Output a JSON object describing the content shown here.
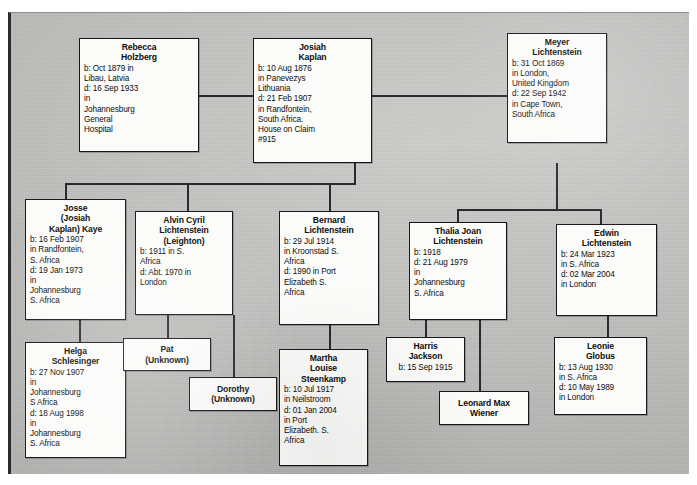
{
  "document": {
    "kind": "genealogy-family-tree-chart",
    "title": "Kaplan / Lichtenstein Family Tree"
  },
  "people": [
    {
      "id": "rebecca-holzberg",
      "name": "Rebecca\nHolzberg",
      "details": "b: Oct 1879 in\nLibau, Latvia\nd: 16 Sep 1933\nin\nJohannesburg\nGeneral\nHospital",
      "generation": 1
    },
    {
      "id": "josiah-kaplan",
      "name": "Josiah\nKaplan",
      "details": "b: 10 Aug 1876\nin Panevezys\nLithuania\nd: 21 Feb 1907\nin Randfontein,\nSouth Africa.\nHouse on Claim\n#915",
      "generation": 1
    },
    {
      "id": "meyer-lichtenstein",
      "name": "Meyer\nLichtenstein",
      "details": "b: 31 Oct 1869\nin London,\nUnited Kingdom\nd: 22 Sep 1942\nin Cape Town,\nSouth Africa",
      "generation": 1
    },
    {
      "id": "josse-kaye",
      "name": "Josse\n(Josiah\nKaplan) Kaye",
      "details": "b: 16 Feb 1907\nin Randfontein,\nS. Africa\nd: 19 Jan 1973\nin\nJohannesburg\nS. Africa",
      "generation": 2
    },
    {
      "id": "alvin-cyril-lichtenstein",
      "name": "Alvin Cyril\nLichtenstein\n(Leighton)",
      "details": "b: 1911 in S.\nAfrica\nd: Abt. 1970 in\nLondon",
      "generation": 2
    },
    {
      "id": "bernard-lichtenstein",
      "name": "Bernard\nLichtenstein",
      "details": "b: 29 Jul 1914\nin Kroonstad S.\nAfrica\nd: 1990 in Port\nElizabeth S.\nAfrica",
      "generation": 2
    },
    {
      "id": "thalia-joan-lichtenstein",
      "name": "Thalia Joan\nLichtenstein",
      "details": "b: 1918\nd: 21 Aug 1979\nin\nJohannesburg\nS. Africa",
      "generation": 2
    },
    {
      "id": "edwin-lichtenstein",
      "name": "Edwin\nLichtenstein",
      "details": "b: 24 Mar 1923\nin S. Africa\nd: 02 Mar 2004\nin London",
      "generation": 2
    },
    {
      "id": "helga-schlesinger",
      "name": "Helga\nSchlesinger",
      "details": "b: 27 Nov 1907\nin\nJohannesburg\nS Africa\nd: 18 Aug 1998\nin\nJohannesburg\nS. Africa",
      "generation": 3
    },
    {
      "id": "pat-unknown",
      "name": "Pat\n(Unknown)",
      "details": "",
      "generation": 3
    },
    {
      "id": "dorothy-unknown",
      "name": "Dorothy\n(Unknown)",
      "details": "",
      "generation": 3
    },
    {
      "id": "martha-louise-steenkamp",
      "name": "Martha\nLouise\nSteenkamp",
      "details": "b: 10 Jul 1917\nin Neilstroom\nd: 01 Jan 2004\nin Port\nElizabeth. S.\nAfrica",
      "generation": 3
    },
    {
      "id": "harris-jackson",
      "name": "Harris\nJackson",
      "details": "b: 15 Sep 1915",
      "generation": 3
    },
    {
      "id": "leonard-max-wiener",
      "name": "Leonard Max\nWiener",
      "details": "",
      "generation": 3
    },
    {
      "id": "leonie-globus",
      "name": "Leonie\nGlobus",
      "details": "b: 13 Aug 1930\nin S. Africa\nd: 10 May 1989\nin London",
      "generation": 3
    }
  ],
  "colors": {
    "box_fill": "#fbfbfa",
    "box_border": "#171717",
    "line": "#2a2a2a",
    "background": "#c2c2c0",
    "text": "#0d0d0d"
  }
}
